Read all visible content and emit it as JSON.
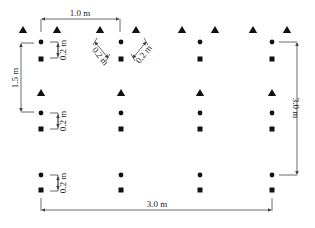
{
  "diagram": {
    "type": "sampling-layout",
    "labels": {
      "top_spacing": "1.0 m",
      "left_row_spacing": "1.5 m",
      "right_total_height": "3.0 m",
      "bottom_total_width": "3.0 m",
      "offset_vertical": "0.2 m",
      "offset_diag_left": "0.2 m",
      "offset_diag_right": "0.2 m",
      "offset_row2": "0.2 m",
      "offset_row3": "0.2 m"
    },
    "columns_x": [
      41,
      121,
      200,
      272
    ],
    "rows": [
      {
        "circle_y": 42,
        "square_y": 59
      },
      {
        "circle_y": 113,
        "square_y": 129
      },
      {
        "circle_y": 175,
        "square_y": 190
      }
    ],
    "top_triangles_x": [
      23,
      57,
      100,
      136,
      182,
      215,
      253,
      287
    ],
    "top_triangles_y": 30,
    "row2_triangles_y": 93,
    "symbols": {
      "triangle": "triangle-marker",
      "circle": "circle-marker",
      "square": "square-marker"
    },
    "colors": {
      "marker": "#111111",
      "line": "#444444",
      "background": "#ffffff"
    }
  }
}
